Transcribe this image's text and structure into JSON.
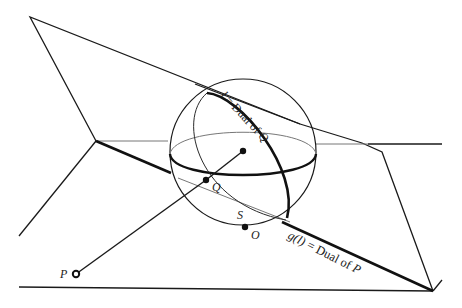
{
  "figure": {
    "type": "projective duality diagram: sphere with planes",
    "colors": {
      "ink": "#1a1a1a",
      "thin": "#2a2a2a",
      "grey": "#777777",
      "background": "#ffffff"
    }
  },
  "labels": {
    "l_dual_Q": {
      "var": "l",
      "text": " = Dual of ",
      "point": "Q"
    },
    "g_dual_P": {
      "var": "g(l)",
      "text": " = Dual of ",
      "point": "P"
    },
    "point_P": "P",
    "point_Q": "Q",
    "point_S": "S",
    "point_O": "O"
  },
  "points": [
    {
      "name": "P",
      "x": 76,
      "y": 274
    },
    {
      "name": "Q",
      "x": 206,
      "y": 180
    },
    {
      "name": "center",
      "x": 243,
      "y": 151
    },
    {
      "name": "O",
      "x": 245,
      "y": 227
    }
  ]
}
